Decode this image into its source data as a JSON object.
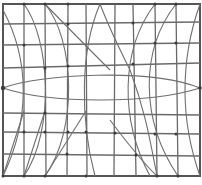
{
  "diagram": {
    "title": "",
    "width": 202,
    "height": 185,
    "colors": {
      "background": "#ffffff",
      "line": "#6a6a6a",
      "node": "#3a3a3a"
    },
    "grid": {
      "vertical_x": [
        3,
        24,
        45,
        68,
        86,
        115,
        133,
        155,
        176,
        200
      ],
      "horizontal_y": [
        4,
        24,
        45,
        66,
        111,
        133,
        154,
        176
      ]
    },
    "lens": {
      "left": [
        3,
        88
      ],
      "right": [
        200,
        88
      ],
      "top_y": 74,
      "bottom_y": 102
    },
    "labels": []
  }
}
